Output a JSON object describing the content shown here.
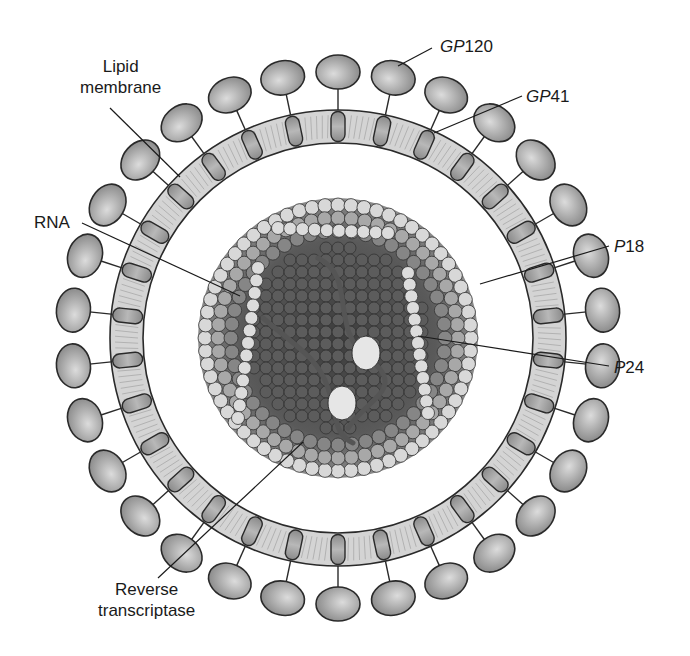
{
  "diagram": {
    "center": [
      338,
      338
    ],
    "colors": {
      "background": "#ffffff",
      "outline": "#2a2a2a",
      "membrane_fill": "#d4d4d4",
      "knob_fill": "#9a9a9a",
      "knob_highlight": "#d8d8d8",
      "core_dark": "#4a4a4a",
      "core_mid": "#7a7a7a",
      "core_light": "#d9d9d9",
      "rna": "#555555",
      "enzyme": "#e6e6e6"
    },
    "geometry": {
      "membrane_outer_r": 228,
      "membrane_inner_r": 195,
      "knob_r": 266,
      "knob_count": 30,
      "core_r": 140
    }
  },
  "labels": {
    "lipid_membrane": {
      "line1": "Lipid",
      "line2": "membrane"
    },
    "gp120": {
      "prefix": "GP",
      "number": "120"
    },
    "gp41": {
      "prefix": "GP",
      "number": "41"
    },
    "rna": {
      "text": "RNA"
    },
    "p18": {
      "prefix": "P",
      "number": "18"
    },
    "p24": {
      "prefix": "P",
      "number": "24"
    },
    "reverse_transcriptase": {
      "line1": "Reverse",
      "line2": "transcriptase"
    }
  }
}
